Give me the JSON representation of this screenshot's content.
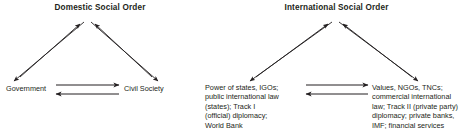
{
  "figure": {
    "background_color": "#ffffff",
    "line_color": "#231f20",
    "text_color": "#231f20"
  },
  "panels": {
    "domestic": {
      "title": "Domestic Social Order",
      "nodes": {
        "left": {
          "lines": [
            "Government"
          ]
        },
        "right": {
          "lines": [
            "Civil Society"
          ]
        }
      }
    },
    "international": {
      "title": "International Social Order",
      "nodes": {
        "left": {
          "lines": [
            "Power of states, IGOs;",
            "public international law",
            "(states); Track I",
            "(official) diplomacy;",
            "World Bank"
          ]
        },
        "right": {
          "lines": [
            "Values, NGOs, TNCs;",
            "commercial international",
            "law; Track II (private party)",
            "diplomacy; private banks,",
            "IMF; financial services"
          ]
        }
      }
    }
  },
  "connections": {
    "apex_left_up": "arrow-up-to-apex",
    "apex_left_down": "arrow-down-to-left-node",
    "apex_right_up": "arrow-up-to-apex",
    "apex_right_down": "arrow-down-to-right-node",
    "base_forward": "arrow-left-to-right",
    "base_backward": "arrow-right-to-left"
  }
}
